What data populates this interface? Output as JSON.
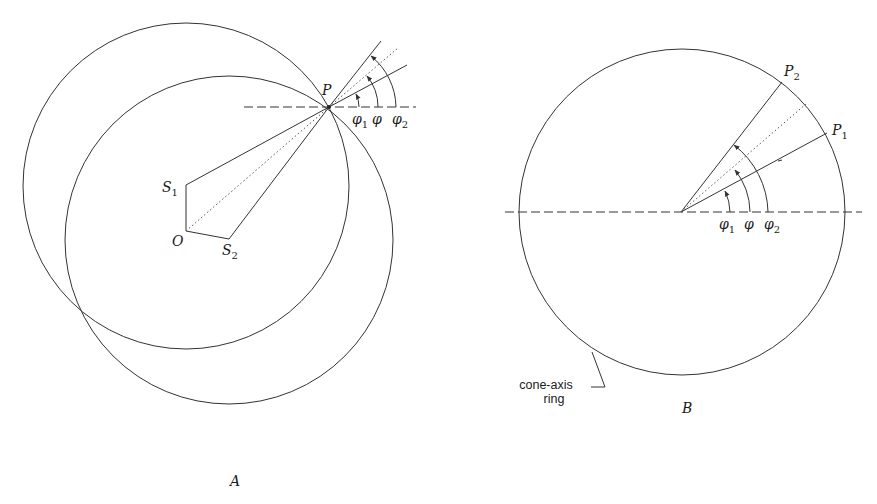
{
  "figure": {
    "panels": [
      {
        "id": "A",
        "label": "A",
        "points": {
          "P": "P",
          "S1": {
            "base": "S",
            "sub": "1"
          },
          "S2": {
            "base": "S",
            "sub": "2"
          },
          "O": "O"
        },
        "angles": [
          {
            "base": "φ",
            "sub": "1"
          },
          {
            "base": "φ",
            "sub": ""
          },
          {
            "base": "φ",
            "sub": "2"
          }
        ]
      },
      {
        "id": "B",
        "label": "B",
        "points": {
          "P1": {
            "base": "P",
            "sub": "1"
          },
          "P2": {
            "base": "P",
            "sub": "2"
          }
        },
        "angles": [
          {
            "base": "φ",
            "sub": "1"
          },
          {
            "base": "φ",
            "sub": ""
          },
          {
            "base": "φ",
            "sub": "2"
          }
        ],
        "callout": {
          "line1": "cone-axis",
          "line2": "ring"
        }
      }
    ],
    "colors": {
      "line": "#333333",
      "text": "#1a1a1a",
      "background": "#ffffff"
    }
  }
}
